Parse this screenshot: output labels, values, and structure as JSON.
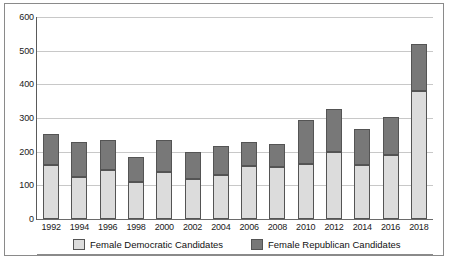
{
  "chart_data": {
    "type": "bar",
    "subtype": "stacked-vertical",
    "title": "",
    "xlabel": "",
    "ylabel": "",
    "ylim": [
      0,
      600
    ],
    "ytick_step": 100,
    "yticks": [
      600,
      500,
      400,
      300,
      200,
      100,
      0
    ],
    "grid": true,
    "grid_axis": "y",
    "legend_position": "bottom",
    "categories": [
      "1992",
      "1994",
      "1996",
      "1998",
      "2000",
      "2002",
      "2004",
      "2006",
      "2008",
      "2010",
      "2012",
      "2014",
      "2016",
      "2018"
    ],
    "series": [
      {
        "name": "Female Democratic Candidates",
        "color": "#dcdcdc",
        "values": [
          160,
          124,
          145,
          109,
          141,
          118,
          132,
          157,
          155,
          163,
          200,
          160,
          190,
          380
        ]
      },
      {
        "name": "Female Republican Candidates",
        "color": "#787878",
        "values": [
          93,
          106,
          90,
          74,
          93,
          82,
          85,
          73,
          68,
          130,
          127,
          108,
          114,
          139
        ]
      }
    ],
    "totals": [
      253,
      230,
      235,
      183,
      234,
      200,
      217,
      230,
      223,
      293,
      327,
      268,
      304,
      519
    ]
  },
  "axis": {
    "y_tick_labels": [
      "600",
      "500",
      "400",
      "300",
      "200",
      "100",
      "0"
    ],
    "x_tick_labels": [
      "1992",
      "1994",
      "1996",
      "1998",
      "2000",
      "2002",
      "2004",
      "2006",
      "2008",
      "2010",
      "2012",
      "2014",
      "2016",
      "2018"
    ]
  },
  "legend": {
    "items": [
      {
        "label": "Female Democratic Candidates",
        "color": "#dcdcdc"
      },
      {
        "label": "Female Republican Candidates",
        "color": "#787878"
      }
    ]
  },
  "colors": {
    "democratic": "#dcdcdc",
    "republican": "#787878",
    "bar_outline": "#545454",
    "gridline": "#c8c8c8",
    "axis": "#5a5a5a",
    "frame": "#8a8a8a",
    "background": "#ffffff"
  }
}
